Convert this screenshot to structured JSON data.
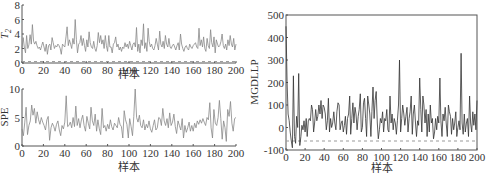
{
  "chart_data": [
    {
      "type": "line",
      "title": "",
      "xlabel": "样本",
      "ylabel": "T2",
      "xlim": [
        0,
        200
      ],
      "ylim": [
        0,
        8
      ],
      "xticks": [
        0,
        20,
        40,
        60,
        80,
        100,
        120,
        140,
        160,
        180,
        200
      ],
      "yticks": [
        0,
        2,
        4,
        6,
        8
      ],
      "control_limit": 0.2,
      "series": [
        {
          "name": "T2",
          "color": "#888888",
          "values": [
            2.0,
            3.5,
            2.2,
            1.4,
            3.8,
            2.0,
            2.5,
            3.9,
            2.6,
            5.3,
            3.0,
            2.6,
            3.0,
            2.4,
            2.0,
            2.2,
            1.8,
            2.4,
            2.9,
            2.2,
            1.6,
            2.6,
            1.2,
            2.4,
            2.6,
            1.8,
            3.5,
            2.8,
            2.0,
            2.4,
            2.2,
            2.6,
            2.4,
            2.0,
            1.2,
            2.6,
            2.4,
            2.2,
            3.6,
            5.0,
            2.4,
            3.2,
            2.6,
            2.0,
            3.4,
            2.6,
            6.0,
            3.2,
            1.4,
            2.6,
            2.8,
            3.8,
            2.4,
            3.4,
            2.4,
            1.6,
            3.2,
            2.2,
            4.3,
            2.8,
            2.2,
            2.0,
            3.0,
            2.0,
            1.6,
            2.4,
            4.2,
            2.8,
            3.8,
            2.6,
            3.2,
            2.0,
            3.8,
            2.4,
            1.6,
            3.8,
            2.2,
            2.2,
            1.4,
            2.6,
            2.8,
            3.6,
            2.2,
            2.6,
            1.8,
            2.2,
            1.6,
            2.2,
            2.0,
            2.8,
            2.2,
            2.6,
            2.0,
            3.0,
            2.4,
            1.8,
            2.6,
            2.8,
            2.2,
            4.9,
            1.6,
            2.6,
            1.4,
            3.2,
            2.4,
            5.4,
            2.0,
            2.8,
            1.6,
            4.8,
            3.0,
            2.2,
            2.6,
            2.0,
            1.8,
            2.4,
            3.4,
            2.6,
            1.8,
            4.4,
            2.6,
            2.2,
            3.0,
            2.0,
            3.8,
            2.6,
            2.2,
            3.4,
            2.2,
            2.0,
            2.4,
            2.6,
            2.2,
            1.8,
            2.4,
            2.8,
            1.8,
            4.0,
            2.6,
            2.0,
            1.6,
            2.2,
            2.4,
            2.0,
            1.8,
            2.6,
            2.2,
            2.0,
            2.4,
            2.6,
            2.8,
            2.2,
            2.0,
            4.8,
            2.4,
            3.2,
            2.2,
            3.6,
            2.0,
            1.6,
            3.4,
            2.4,
            2.0,
            4.6,
            2.8,
            2.2,
            3.6,
            1.4,
            3.2,
            2.6,
            2.2,
            2.4,
            3.0,
            4.0,
            2.4,
            2.0,
            2.6,
            1.8,
            3.2,
            2.4,
            3.8,
            2.6,
            2.2,
            3.4,
            1.8,
            2.6
          ]
        }
      ]
    },
    {
      "type": "line",
      "title": "",
      "xlabel": "样本",
      "ylabel": "SPE",
      "xlim": [
        0,
        200
      ],
      "ylim": [
        0,
        10
      ],
      "xticks": [
        0,
        20,
        40,
        60,
        80,
        100,
        120,
        140,
        160,
        180,
        200
      ],
      "yticks": [
        0,
        5,
        10
      ],
      "series": [
        {
          "name": "SPE",
          "color": "#888888",
          "values": [
            3.0,
            1.8,
            4.2,
            6.8,
            2.0,
            3.6,
            4.4,
            7.2,
            5.4,
            6.6,
            4.0,
            6.0,
            4.6,
            3.8,
            5.0,
            4.2,
            3.6,
            2.8,
            4.6,
            5.2,
            1.0,
            3.2,
            4.0,
            3.4,
            2.6,
            3.8,
            4.4,
            2.8,
            1.8,
            3.6,
            3.0,
            4.2,
            8.8,
            3.4,
            3.6,
            4.2,
            3.2,
            5.0,
            3.4,
            7.0,
            3.6,
            4.8,
            3.2,
            4.6,
            5.4,
            3.6,
            2.6,
            5.2,
            4.0,
            3.0,
            6.8,
            4.4,
            3.6,
            5.6,
            2.6,
            4.6,
            3.0,
            2.0,
            6.6,
            3.2,
            3.6,
            2.6,
            3.8,
            3.0,
            4.6,
            3.4,
            2.8,
            4.0,
            3.6,
            3.2,
            5.0,
            3.8,
            3.4,
            1.4,
            6.2,
            4.6,
            3.8,
            1.4,
            4.8,
            3.4,
            1.8,
            5.2,
            10.0,
            5.0,
            4.2,
            5.4,
            3.6,
            3.2,
            4.6,
            2.8,
            3.8,
            3.2,
            4.4,
            3.0,
            2.4,
            3.6,
            4.6,
            2.8,
            3.2,
            5.0,
            4.8,
            3.6,
            6.6,
            4.4,
            3.6,
            4.8,
            3.2,
            5.8,
            3.6,
            4.2,
            5.6,
            3.4,
            2.2,
            4.4,
            3.6,
            2.8,
            4.8,
            1.4,
            3.6,
            2.4,
            3.2,
            4.2,
            2.6,
            3.6,
            2.6,
            4.0,
            3.2,
            4.4,
            3.8,
            4.6,
            4.0,
            4.8,
            4.2,
            3.6,
            5.0,
            4.6,
            7.6,
            3.2,
            1.4,
            6.4,
            4.0,
            3.6,
            5.0,
            8.0,
            4.8,
            1.2,
            4.4,
            3.2,
            0.8,
            6.4,
            5.2,
            7.8,
            4.0,
            2.6,
            4.8,
            5.0
          ]
        }
      ]
    },
    {
      "type": "line",
      "title": "",
      "xlabel": "样本",
      "ylabel": "MGDLLP",
      "xlim": [
        0,
        200
      ],
      "ylim": [
        -100,
        500
      ],
      "xticks": [
        0,
        20,
        40,
        60,
        80,
        100,
        120,
        140,
        160,
        180,
        200
      ],
      "yticks": [
        -100,
        0,
        100,
        200,
        300,
        400,
        500
      ],
      "control_limit": -60,
      "series": [
        {
          "name": "MGDLLP",
          "color": "#333333",
          "values": [
            450,
            200,
            60,
            30,
            -20,
            -60,
            -90,
            230,
            -40,
            -70,
            50,
            0,
            240,
            -80,
            -40,
            10,
            -10,
            30,
            -20,
            40,
            -40,
            30,
            40,
            30,
            100,
            80,
            -20,
            20,
            80,
            30,
            50,
            100,
            60,
            120,
            40,
            100,
            90,
            60,
            -10,
            30,
            130,
            -20,
            40,
            0,
            20,
            70,
            20,
            -10,
            70,
            110,
            100,
            -10,
            20,
            30,
            -20,
            10,
            50,
            -30,
            40,
            60,
            140,
            -30,
            40,
            110,
            20,
            90,
            60,
            -10,
            50,
            80,
            150,
            -20,
            0,
            110,
            130,
            40,
            -40,
            140,
            100,
            60,
            -40,
            70,
            180,
            40,
            120,
            160,
            20,
            -50,
            -10,
            40,
            20,
            70,
            -20,
            40,
            30,
            80,
            -10,
            -20,
            140,
            20,
            60,
            -10,
            40,
            20,
            -30,
            30,
            100,
            300,
            -20,
            40,
            100,
            60,
            10,
            50,
            90,
            -20,
            40,
            70,
            140,
            -30,
            60,
            100,
            20,
            -40,
            30,
            10,
            220,
            80,
            -20,
            140,
            100,
            20,
            80,
            -40,
            60,
            -20,
            100,
            20,
            40,
            -50,
            -20,
            40,
            -10,
            50,
            20,
            220,
            30,
            -40,
            60,
            30,
            90,
            20,
            -40,
            100,
            70,
            50,
            -30,
            40,
            -10,
            20,
            70,
            -40,
            0,
            30,
            -10,
            330,
            20,
            -30,
            60,
            -20,
            20,
            40,
            -40,
            140,
            20,
            -20,
            70,
            10,
            60,
            -10,
            120
          ]
        }
      ]
    }
  ]
}
